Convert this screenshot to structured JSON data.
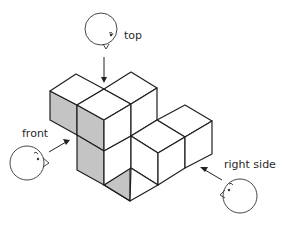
{
  "figure": {
    "colors": {
      "background": "#ffffff",
      "line": "#1f1f1f",
      "shaded_face": "#c4c4c4",
      "white_face": "#ffffff"
    },
    "labels": {
      "top": "top",
      "front": "front",
      "right": "right side"
    },
    "viewers": [
      {
        "id": "top-viewer",
        "label": "top",
        "direction": "down"
      },
      {
        "id": "front-viewer",
        "label": "front",
        "direction": "up-right"
      },
      {
        "id": "right-viewer",
        "label": "right side",
        "direction": "up-left"
      }
    ],
    "shaded_faces": "front-facing faces of the solid"
  }
}
